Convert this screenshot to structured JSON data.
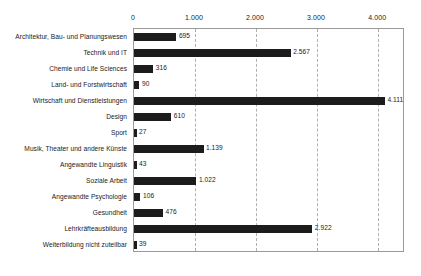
{
  "chart_data": {
    "type": "bar",
    "orientation": "horizontal",
    "title": "",
    "subtitle": "",
    "xlabel": "",
    "ylabel": "",
    "xlim": [
      0,
      4440
    ],
    "grid": true,
    "grid_axis": "x",
    "legend": false,
    "legend_position": "none",
    "xticks": [
      0,
      1000,
      2000,
      3000,
      4000
    ],
    "xtick_labels": [
      "0",
      "1.000",
      "2.000",
      "3.000",
      "4.000"
    ],
    "categories": [
      "Architektur, Bau- und Planungswesen",
      "Technik und IT",
      "Chemie und Life Sciences",
      "Land- und Forstwirtschaft",
      "Wirtschaft und Dienstleistungen",
      "Design",
      "Sport",
      "Musik, Theater und andere Künste",
      "Angewandte Linguistik",
      "Soziale Arbeit",
      "Angewandte Psychologie",
      "Gesundheit",
      "Lehrkräfteausbildung",
      "Weiterbildung nicht zuteilbar"
    ],
    "values": [
      695,
      2567,
      316,
      90,
      4111,
      610,
      27,
      1139,
      43,
      1022,
      106,
      476,
      2922,
      39
    ],
    "value_labels": [
      "695",
      "2.567",
      "316",
      "90",
      "4.111",
      "610",
      "27",
      "1.139",
      "43",
      "1.022",
      "106",
      "476",
      "2.922",
      "39"
    ],
    "bar_color": "#1c1c1c",
    "grid_color": "#b0b0b0",
    "axis_color": "#9a9a9a",
    "text_color": "#1a1a1a",
    "background_color": "#ffffff"
  }
}
